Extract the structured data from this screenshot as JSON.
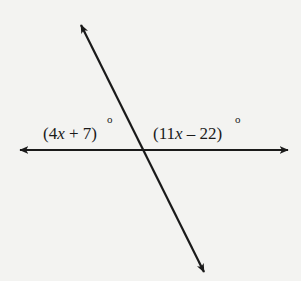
{
  "diagram": {
    "type": "intersecting-lines",
    "colors": {
      "background": "#f3f3f1",
      "stroke": "#1a1a1a"
    },
    "horizontal_line": {
      "x1": 20,
      "y1": 150,
      "x2": 288,
      "y2": 150,
      "arrows": "both"
    },
    "transversal_line": {
      "x1": 81,
      "y1": 25,
      "x2": 204,
      "y2": 272,
      "arrows": "both"
    },
    "intersection": {
      "x": 145,
      "y": 150
    },
    "angles": [
      {
        "position": "upper-left",
        "expression": "(4x + 7)",
        "open": "(",
        "coef": "4",
        "var": "x",
        "rest": " + 7)",
        "degree_symbol": "o"
      },
      {
        "position": "upper-right",
        "expression": "(11x − 22)",
        "open": "(",
        "coef": "11",
        "var": "x",
        "rest": " – 22)",
        "degree_symbol": "o"
      }
    ]
  }
}
